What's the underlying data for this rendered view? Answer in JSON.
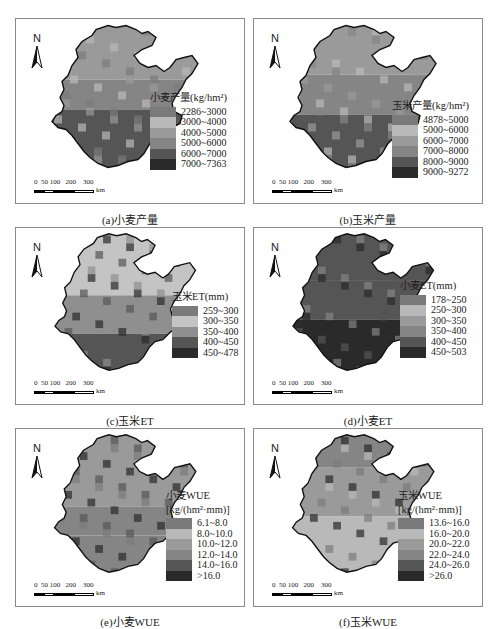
{
  "north_label": "N",
  "scale": {
    "ticks": "0  50 100   200    300",
    "unit": "km"
  },
  "panels": [
    {
      "id": "a",
      "caption": "(a)小麦产量",
      "legend": {
        "title": "小麦产量(kg/hm²)",
        "title2": "",
        "items": [
          {
            "label": "2286~3000",
            "color": "#7a7a7a"
          },
          {
            "label": "3000~4000",
            "color": "#b9b9b9"
          },
          {
            "label": "4000~5000",
            "color": "#9a9a9a"
          },
          {
            "label": "5000~6000",
            "color": "#858585"
          },
          {
            "label": "6000~7000",
            "color": "#555555"
          },
          {
            "label": "7000~7363",
            "color": "#2a2a2a"
          }
        ]
      }
    },
    {
      "id": "b",
      "caption": "(b)玉米产量",
      "legend": {
        "title": "玉米产量(kg/hm²)",
        "title2": "",
        "items": [
          {
            "label": "4878~5000",
            "color": "#7a7a7a"
          },
          {
            "label": "5000~6000",
            "color": "#b9b9b9"
          },
          {
            "label": "6000~7000",
            "color": "#9a9a9a"
          },
          {
            "label": "7000~8000",
            "color": "#858585"
          },
          {
            "label": "8000~9000",
            "color": "#555555"
          },
          {
            "label": "9000~9272",
            "color": "#2a2a2a"
          }
        ]
      }
    },
    {
      "id": "c",
      "caption": "(c)玉米ET",
      "legend": {
        "title": "玉米ET(mm)",
        "title2": "",
        "items": [
          {
            "label": "259~300",
            "color": "#7a7a7a"
          },
          {
            "label": "300~350",
            "color": "#c4c4c4"
          },
          {
            "label": "350~400",
            "color": "#8f8f8f"
          },
          {
            "label": "400~450",
            "color": "#555555"
          },
          {
            "label": "450~478",
            "color": "#2a2a2a"
          }
        ]
      }
    },
    {
      "id": "d",
      "caption": "(d)小麦ET",
      "legend": {
        "title": "小麦ET(mm)",
        "title2": "",
        "items": [
          {
            "label": "178~250",
            "color": "#7a7a7a"
          },
          {
            "label": "250~300",
            "color": "#b9b9b9"
          },
          {
            "label": "300~350",
            "color": "#9a9a9a"
          },
          {
            "label": "350~400",
            "color": "#858585"
          },
          {
            "label": "400~450",
            "color": "#555555"
          },
          {
            "label": "450~503",
            "color": "#2a2a2a"
          }
        ]
      }
    },
    {
      "id": "e",
      "caption": "(e)小麦WUE",
      "legend": {
        "title": "小麦WUE",
        "title2": "[kg/(hm²·mm)]",
        "items": [
          {
            "label": "6.1~8.0",
            "color": "#7a7a7a"
          },
          {
            "label": "8.0~10.0",
            "color": "#b9b9b9"
          },
          {
            "label": "10.0~12.0",
            "color": "#9a9a9a"
          },
          {
            "label": "12.0~14.0",
            "color": "#858585"
          },
          {
            "label": "14.0~16.0",
            "color": "#555555"
          },
          {
            "label": ">16.0",
            "color": "#2a2a2a"
          }
        ]
      }
    },
    {
      "id": "f",
      "caption": "(f)玉米WUE",
      "legend": {
        "title": "玉米WUE",
        "title2": "[kg/(hm²·mm)]",
        "items": [
          {
            "label": "13.6~16.0",
            "color": "#7a7a7a"
          },
          {
            "label": "16.0~20.0",
            "color": "#b9b9b9"
          },
          {
            "label": "20.0~22.0",
            "color": "#9a9a9a"
          },
          {
            "label": "22.0~24.0",
            "color": "#858585"
          },
          {
            "label": "24.0~26.0",
            "color": "#555555"
          },
          {
            "label": ">26.0",
            "color": "#2a2a2a"
          }
        ]
      }
    }
  ]
}
